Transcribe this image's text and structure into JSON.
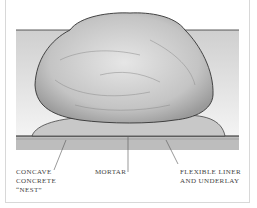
{
  "figure": {
    "labels": [
      {
        "id": "nest",
        "lines": [
          "CONCAVE",
          "CONCRETE",
          "“NEST”"
        ]
      },
      {
        "id": "mortar",
        "lines": [
          "MORTAR"
        ]
      },
      {
        "id": "liner",
        "lines": [
          "FLEXIBLE LINER",
          "AND UNDERLAY"
        ]
      }
    ]
  }
}
